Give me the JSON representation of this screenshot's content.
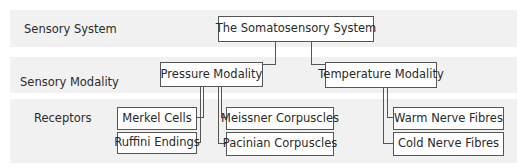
{
  "levels": [
    {
      "label": "Sensory System"
    },
    {
      "label": "Sensory Modality"
    },
    {
      "label": "Receptors"
    }
  ],
  "root": {
    "label": "The Somatosensory System"
  },
  "modalities": [
    {
      "label": "Pressure Modality",
      "receptors": [
        {
          "label": "Merkel Cells"
        },
        {
          "label": "Ruffini Endings"
        },
        {
          "label": "Meissner Corpuscles"
        },
        {
          "label": "Pacinian Corpuscles"
        }
      ]
    },
    {
      "label": "Temperature Modality",
      "receptors": [
        {
          "label": "Warm Nerve Fibres"
        },
        {
          "label": "Cold Nerve Fibres"
        }
      ]
    }
  ],
  "colors": {
    "band_background": "#f1f1f1",
    "node_border": "#555555",
    "node_background": "#ffffff",
    "connector": "#555555"
  }
}
